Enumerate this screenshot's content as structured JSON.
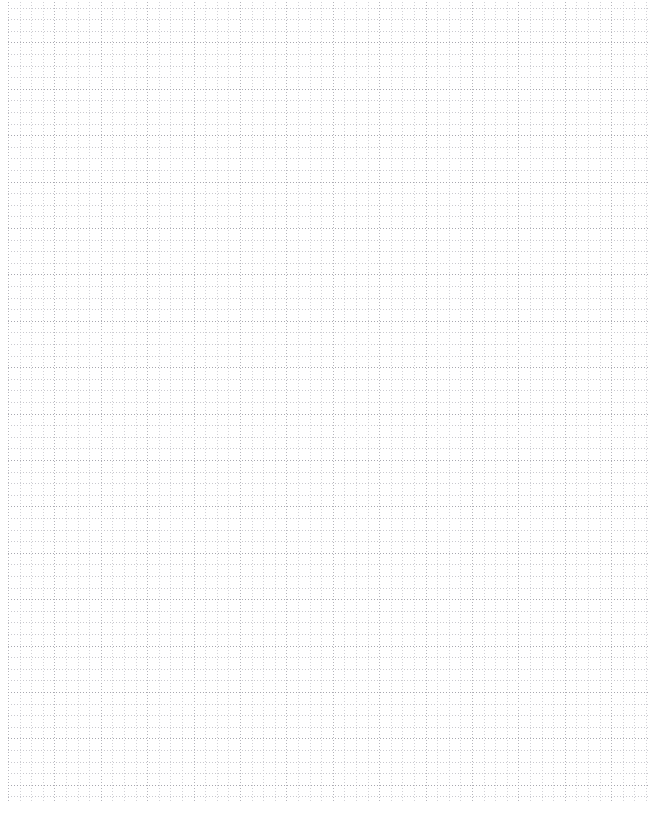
{
  "document": {
    "type": "grid-paper",
    "title": "",
    "background_color": "#ffffff",
    "text_content": ""
  },
  "grid": {
    "minor_cell_px": 11.6,
    "major_cell_px": 46.4,
    "minor_cells_per_major": 4,
    "line_style": "dotted",
    "minor_line_color": "#c9c9cf",
    "major_line_color": "#a8a8b0",
    "minor_line_width_px": 1,
    "major_line_width_px": 1,
    "dot_period_px": 3,
    "sheet_left_px": 8,
    "sheet_top_px": -4,
    "sheet_width_px": 642,
    "sheet_height_px": 805,
    "columns_minor": 55,
    "rows_minor": 69,
    "columns_major": 14,
    "rows_major": 17,
    "margin_left_px": 8,
    "margin_right_px": 10,
    "margin_bottom_px": 12,
    "top_clipped": true
  },
  "page": {
    "width_px": 660,
    "height_px": 813
  }
}
